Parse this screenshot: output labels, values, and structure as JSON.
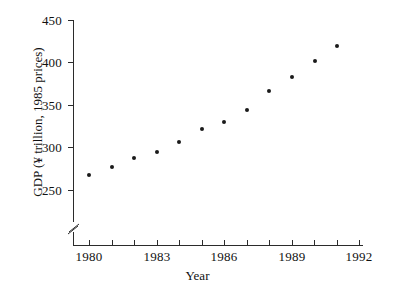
{
  "chart_data": {
    "type": "scatter",
    "title": "",
    "xlabel": "Year",
    "ylabel": "GDP (¥ trillion, 1985 prices)",
    "x": [
      1980,
      1981,
      1982,
      1983,
      1984,
      1985,
      1986,
      1987,
      1988,
      1989,
      1990,
      1991
    ],
    "values": [
      268,
      277,
      288,
      295,
      306,
      322,
      330,
      344,
      366,
      383,
      402,
      420
    ],
    "series": [
      {
        "name": "GDP",
        "values": [
          268,
          277,
          288,
          295,
          306,
          322,
          330,
          344,
          366,
          383,
          402,
          420
        ]
      }
    ],
    "xlim": [
      1979,
      1992
    ],
    "ylim": [
      250,
      450
    ],
    "y_ticks": [
      250,
      300,
      350,
      400,
      450
    ],
    "y_tick_labels": [
      "250",
      "300",
      "350",
      "400",
      "450"
    ],
    "x_ticks": [
      1980,
      1981,
      1982,
      1983,
      1984,
      1985,
      1986,
      1987,
      1988,
      1989,
      1990,
      1991,
      1992
    ],
    "x_tick_labels_major": [
      "1980",
      "1983",
      "1986",
      "1989",
      "1992"
    ],
    "x_major_ticks": [
      1980,
      1983,
      1986,
      1989,
      1992
    ],
    "grid": false,
    "legend": false,
    "legend_position": "none",
    "y_axis_break": true,
    "y_axis_break_note": "axis broken below 250",
    "marker": "filled-circle",
    "marker_color": "#1a1a1a",
    "axis_color": "#2b2b2b",
    "background_color": "#ffffff"
  }
}
